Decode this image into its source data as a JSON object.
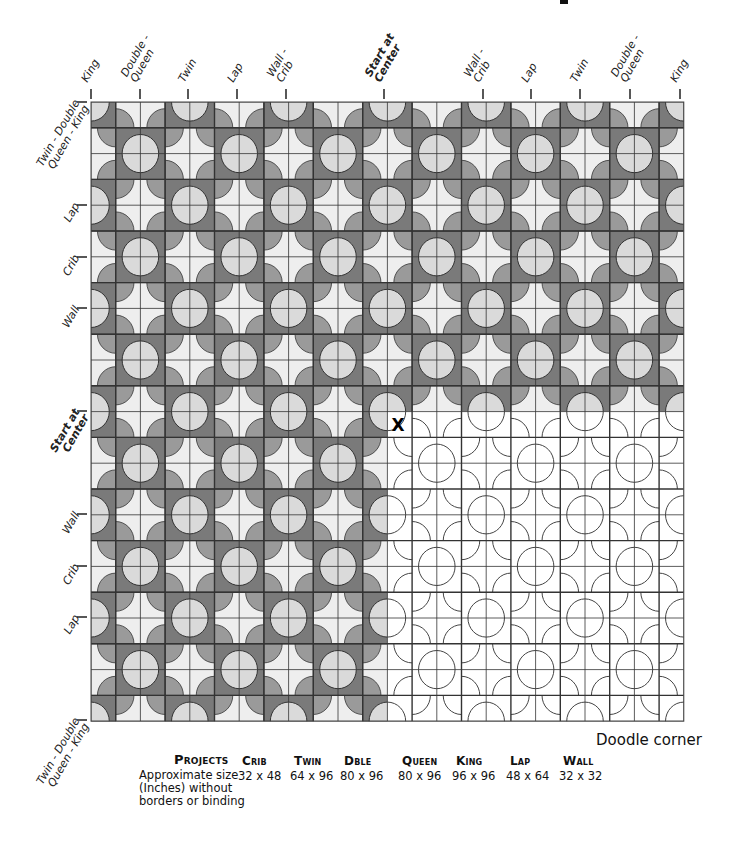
{
  "quilt": {
    "grid": {
      "left": 91,
      "top": 102,
      "cols": 24,
      "rows": 24,
      "cell_w": 24.7,
      "cell_h": 25.8
    },
    "doodle_start": {
      "col": 12,
      "row": 12
    },
    "center_mark": "X",
    "colors": {
      "background": "#eeeeee",
      "dark_square": "#7a7a7a",
      "light_circle": "#dadada",
      "petal": "#9a9a9a",
      "grid_line": "#333333",
      "outline": "#333333"
    }
  },
  "top_labels": [
    {
      "text": "King",
      "x": 91,
      "bold": false
    },
    {
      "text": "Double -\nQueen",
      "x": 140,
      "bold": false
    },
    {
      "text": "Twin",
      "x": 188,
      "bold": false
    },
    {
      "text": "Lap",
      "x": 237,
      "bold": false
    },
    {
      "text": "Wall -\nCrib",
      "x": 286,
      "bold": false
    },
    {
      "text": "Start at\nCenter",
      "x": 384,
      "bold": true
    },
    {
      "text": "Wall -\nCrib",
      "x": 483,
      "bold": false
    },
    {
      "text": "Lap",
      "x": 531,
      "bold": false
    },
    {
      "text": "Twin",
      "x": 580,
      "bold": false
    },
    {
      "text": "Double -\nQueen",
      "x": 630,
      "bold": false
    },
    {
      "text": "King",
      "x": 680,
      "bold": false
    }
  ],
  "left_labels": [
    {
      "text": "Twin - Double\nQueen - King",
      "y": 102,
      "bold": false
    },
    {
      "text": "Lap",
      "y": 205,
      "bold": false
    },
    {
      "text": "Crib",
      "y": 257,
      "bold": false
    },
    {
      "text": "Wall",
      "y": 308,
      "bold": false
    },
    {
      "text": "Start at\nCenter",
      "y": 411,
      "bold": true
    },
    {
      "text": "Wall",
      "y": 514,
      "bold": false
    },
    {
      "text": "Crib",
      "y": 566,
      "bold": false
    },
    {
      "text": "Lap",
      "y": 617,
      "bold": false
    },
    {
      "text": "Twin - Double\nQueen - King",
      "y": 720,
      "bold": false
    }
  ],
  "doodle_label": "Doodle corner",
  "table": {
    "header_label": "Projects",
    "row_label": "Approximate size\n(Inches) without\nborders or binding",
    "columns": [
      {
        "name": "Crib",
        "size": "32 x 48",
        "x": 242
      },
      {
        "name": "Twin",
        "size": "64 x 96",
        "x": 294
      },
      {
        "name": "Dble",
        "size": "80 x 96",
        "x": 344
      },
      {
        "name": "Queen",
        "size": "80 x 96",
        "x": 402
      },
      {
        "name": "King",
        "size": "96 x 96",
        "x": 456
      },
      {
        "name": "Lap",
        "size": "48 x 64",
        "x": 510
      },
      {
        "name": "Wall",
        "size": "32 x 32",
        "x": 563
      }
    ]
  }
}
